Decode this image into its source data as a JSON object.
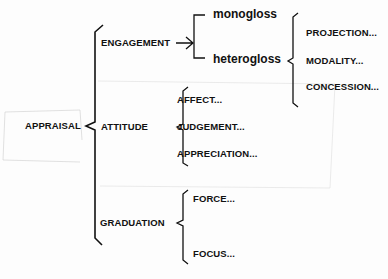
{
  "diagram": {
    "root": "APPRAISAL",
    "systems": {
      "engagement": {
        "label": "ENGAGEMENT",
        "options": [
          "monogloss",
          "heterogloss"
        ],
        "heterogloss_options": [
          "PROJECTION...",
          "MODALITY...",
          "CONCESSION..."
        ]
      },
      "attitude": {
        "label": "ATTITUDE",
        "options": [
          "AFFECT...",
          "JUDGEMENT...",
          "APPRECIATION..."
        ]
      },
      "graduation": {
        "label": "GRADUATION",
        "options": [
          "FORCE...",
          "FOCUS..."
        ]
      }
    }
  }
}
